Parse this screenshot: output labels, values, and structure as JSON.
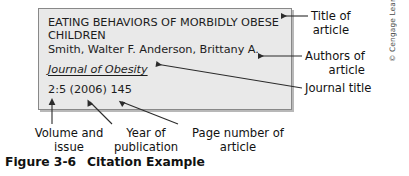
{
  "figure": {
    "caption_number": "Figure 3-6",
    "caption_title": "Citation Example",
    "copyright": "© Cengage Learning"
  },
  "citation": {
    "title": "EATING BEHAVIORS OF MORBIDLY OBESE CHILDREN",
    "authors": "Smith, Walter F. Anderson, Brittany A.",
    "journal": "Journal of Obesity",
    "volume_issue_year_page": "2:5 (2006) 145"
  },
  "annotations": {
    "title_of": "Title of",
    "title_article": "article",
    "authors_of": "Authors of",
    "authors_article": "article",
    "journal_title": "Journal title",
    "volume_line1": "Volume and",
    "volume_line2": "issue",
    "year_line1": "Year of",
    "year_line2": "publication",
    "page_line1": "Page number of",
    "page_line2": "article"
  },
  "colors": {
    "box_fill": "#e9e9e9",
    "box_border": "#888888",
    "text": "#1a1a1a",
    "leader_line": "#2b2b2b",
    "page_background": "#ffffff"
  }
}
